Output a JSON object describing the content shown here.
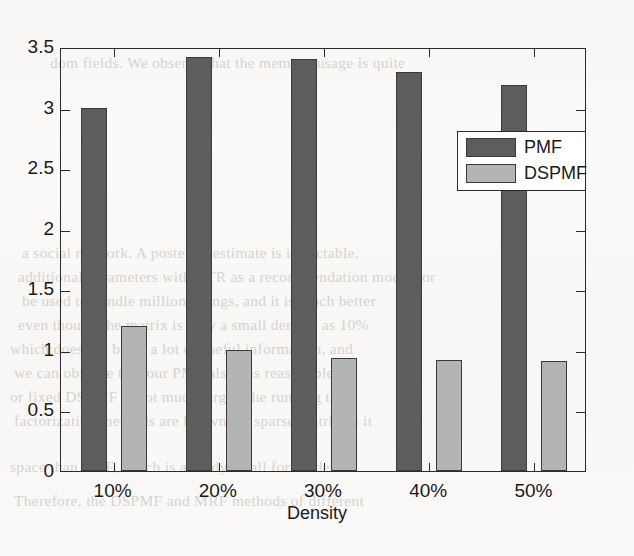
{
  "chart_data": {
    "type": "bar",
    "title": "",
    "xlabel": "Density",
    "ylabel": "",
    "categories": [
      "10%",
      "20%",
      "30%",
      "40%",
      "50%"
    ],
    "series": [
      {
        "name": "PMF",
        "color": "#5d5d5d",
        "values": [
          3.0,
          3.42,
          3.4,
          3.29,
          3.19
        ]
      },
      {
        "name": "DSPMF",
        "color": "#b4b4b4",
        "values": [
          1.2,
          1.0,
          0.93,
          0.92,
          0.91
        ]
      }
    ],
    "ylim": [
      0,
      3.5
    ],
    "yticks": [
      0,
      0.5,
      1,
      1.5,
      2,
      2.5,
      3,
      3.5
    ],
    "ytick_labels": [
      "0",
      "0.5",
      "1",
      "1.5",
      "2",
      "2.5",
      "3",
      "3.5"
    ],
    "grid": false,
    "legend_position": "center-right"
  },
  "legend": {
    "entries": [
      {
        "label": "PMF"
      },
      {
        "label": "DSPMF"
      }
    ]
  },
  "axes": {
    "x_title": "Density"
  },
  "background_text": {
    "lines": [
      "dom fields. We observe that the memory usage is quite",
      "a social network. A posterior estimate is intractable,",
      "additional parameters with CTR as a recommendation model for",
      "be used to handle million ratings, and it is much better",
      "even though the matrix is only a small density as 10%",
      "which does not bring a lot of useful information, and",
      "we can observe that our PMF also has reasonable",
      "or fixed DSPMF is not much larger, the running time",
      "factorization methods are known for sparse matrix as it",
      "space than PMF, which is already small for moderate",
      "Therefore, the DSPMF and MRF methods of different"
    ]
  }
}
